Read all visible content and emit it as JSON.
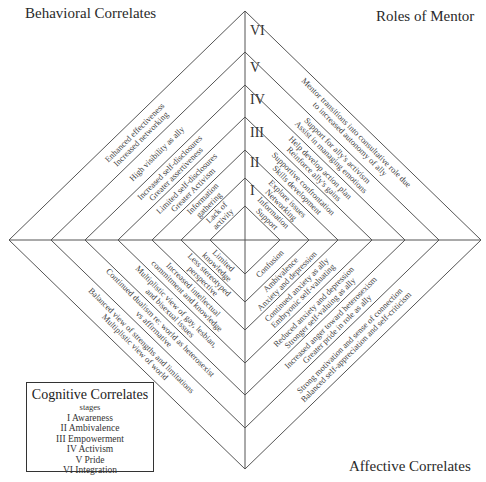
{
  "titles": {
    "behavioral": "Behavioral Correlates",
    "roles": "Roles of Mentor",
    "affective": "Affective Correlates"
  },
  "stage_numerals": [
    "I",
    "II",
    "III",
    "IV",
    "V",
    "VI"
  ],
  "legend": {
    "title": "Cognitive Correlates",
    "subtitle": "stages",
    "stages": [
      "I Awareness",
      "II Ambivalence",
      "III Empowerment",
      "IV Activism",
      "V Pride",
      "VI Integration"
    ]
  },
  "geometry": {
    "center": [
      245,
      240
    ],
    "half_widths": [
      35,
      64,
      93,
      127,
      160,
      194,
      236
    ],
    "half_heights": [
      34,
      62,
      90,
      123,
      155,
      188,
      229
    ],
    "line_color": "#555555"
  },
  "quadrants": {
    "behavioral": {
      "bands": [
        [
          "Lack of",
          "activity"
        ],
        [
          "Information",
          "gathering"
        ],
        [
          "Limited self-disclosures",
          "Greater Activism"
        ],
        [
          "Increased self-disclosures",
          "Greater assertiveness"
        ],
        [
          "High visibility as ally"
        ],
        [
          "Enhanced effectiveness",
          "Increased networking"
        ]
      ]
    },
    "roles": {
      "bands": [
        [
          "Information",
          "Support"
        ],
        [
          "Explore issues",
          "Networking"
        ],
        [
          "Supportive confrontation",
          "Skills development"
        ],
        [
          "Help develop action plan",
          "Reinforce ally's gains"
        ],
        [
          "Support for ally's activism",
          "Assist in managing emotions"
        ],
        [
          "Mentor transitions into consultative role due",
          "to increased autonomy of ally"
        ]
      ]
    },
    "cognitive": {
      "bands": [
        [
          "Limited",
          "knowledge"
        ],
        [
          "Less stereotyped",
          "perspective"
        ],
        [
          "Increased intellectual",
          "commitment and knowledge"
        ],
        [
          "Multiplistic view of gay, lesbian,",
          "and bisexual issues"
        ],
        [
          "Continued dualism re: world as heterosexist",
          "vs affirmative"
        ],
        [
          "Balanced view of strengths and limitations",
          "Multiplistic view of world"
        ]
      ]
    },
    "affective": {
      "bands": [
        [
          "Confusion"
        ],
        [
          "Ambivalence",
          "Anxiety and depression"
        ],
        [
          "Continued anxiety as ally",
          "Embryonic self-valuating"
        ],
        [
          "Reduced anxiety and depression",
          "Stronger self-valuing as ally"
        ],
        [
          "Increased anger toward heterosexism",
          "Greater pride in role as ally"
        ],
        [
          "Strong motivation and sense of connection",
          "Balanced self-appreciation and self-criticism"
        ]
      ]
    }
  }
}
